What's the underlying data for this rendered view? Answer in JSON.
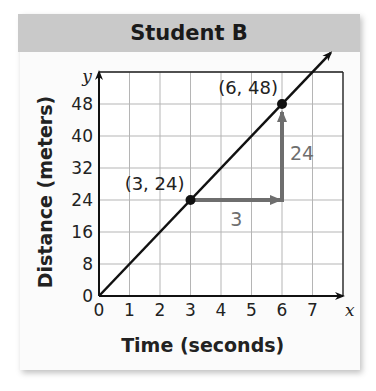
{
  "header": {
    "title": "Student B"
  },
  "chart_data": {
    "type": "line",
    "title": "Student B",
    "xlabel": "Time (seconds)",
    "ylabel": "Distance (meters)",
    "x_axis_var": "x",
    "y_axis_var": "y",
    "xlim": [
      0,
      8
    ],
    "ylim": [
      0,
      56
    ],
    "x_ticks": [
      0,
      1,
      2,
      3,
      4,
      5,
      6,
      7
    ],
    "y_ticks": [
      0,
      8,
      16,
      24,
      32,
      40,
      48
    ],
    "grid": true,
    "series": [
      {
        "name": "Student B",
        "x": [
          0,
          7.6
        ],
        "y": [
          0,
          60.8
        ],
        "slope": 8
      }
    ],
    "points": [
      {
        "x": 3,
        "y": 24,
        "label": "(3, 24)"
      },
      {
        "x": 6,
        "y": 48,
        "label": "(6, 48)"
      }
    ],
    "annotations": [
      {
        "type": "run-arrow",
        "from": [
          3,
          24
        ],
        "to": [
          6,
          24
        ],
        "label": "3"
      },
      {
        "type": "rise-arrow",
        "from": [
          6,
          24
        ],
        "to": [
          6,
          48
        ],
        "label": "24"
      }
    ]
  }
}
